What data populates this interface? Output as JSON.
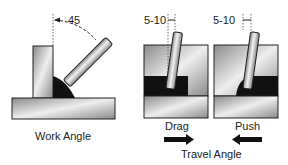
{
  "work_angle": {
    "angle_label": "45",
    "caption": "Work Angle"
  },
  "drag": {
    "angle_label": "5-10",
    "caption": "Drag",
    "arrow_direction": "right"
  },
  "push": {
    "angle_label": "5-10",
    "caption": "Push",
    "arrow_direction": "left"
  },
  "travel_angle": {
    "caption": "Travel Angle"
  },
  "colors": {
    "metal_dark": "#8a8a8a",
    "metal_light": "#e8e8e8",
    "weld": "#111111",
    "outline": "#222222"
  }
}
